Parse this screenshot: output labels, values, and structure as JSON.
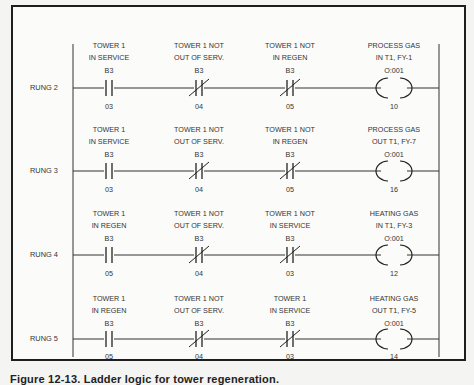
{
  "diagram": {
    "type": "ladder-logic",
    "rails": {
      "left_x": 73,
      "right_x": 439
    },
    "columns_x": [
      109,
      199,
      290,
      394
    ],
    "rungs": [
      {
        "label": "RUNG 2",
        "y": 88,
        "elements": [
          {
            "kind": "NO",
            "desc1": "TOWER 1",
            "desc2": "IN SERVICE",
            "addr": "B3",
            "bit": "03"
          },
          {
            "kind": "NC",
            "desc1": "TOWER 1 NOT",
            "desc2": "OUT OF SERV.",
            "addr": "B3",
            "bit": "04"
          },
          {
            "kind": "NC",
            "desc1": "TOWER 1 NOT",
            "desc2": "IN REGEN",
            "addr": "B3",
            "bit": "05"
          },
          {
            "kind": "COIL",
            "desc1": "PROCESS GAS",
            "desc2": "IN T1, FY-1",
            "addr": "O:001",
            "bit": "10"
          }
        ]
      },
      {
        "label": "RUNG 3",
        "y": 171,
        "elements": [
          {
            "kind": "NO",
            "desc1": "TOWER 1",
            "desc2": "IN SERVICE",
            "addr": "B3",
            "bit": "03"
          },
          {
            "kind": "NC",
            "desc1": "TOWER 1 NOT",
            "desc2": "OUT OF SERV.",
            "addr": "B3",
            "bit": "04"
          },
          {
            "kind": "NC",
            "desc1": "TOWER 1 NOT",
            "desc2": "IN REGEN",
            "addr": "B3",
            "bit": "05"
          },
          {
            "kind": "COIL",
            "desc1": "PROCESS GAS",
            "desc2": "OUT T1, FY-7",
            "addr": "O:001",
            "bit": "16"
          }
        ]
      },
      {
        "label": "RUNG 4",
        "y": 255,
        "elements": [
          {
            "kind": "NO",
            "desc1": "TOWER 1",
            "desc2": "IN REGEN",
            "addr": "B3",
            "bit": "05"
          },
          {
            "kind": "NC",
            "desc1": "TOWER 1 NOT",
            "desc2": "OUT OF SERV.",
            "addr": "B3",
            "bit": "04"
          },
          {
            "kind": "NC",
            "desc1": "TOWER 1 NOT",
            "desc2": "IN SERVICE",
            "addr": "B3",
            "bit": "03"
          },
          {
            "kind": "COIL",
            "desc1": "HEATING GAS",
            "desc2": "IN T1, FY-3",
            "addr": "O:001",
            "bit": "12"
          }
        ]
      },
      {
        "label": "RUNG 5",
        "y": 339,
        "elements": [
          {
            "kind": "NO",
            "desc1": "TOWER 1",
            "desc2": "IN REGEN",
            "addr": "B3",
            "bit": "05"
          },
          {
            "kind": "NC",
            "desc1": "TOWER 1 NOT",
            "desc2": "OUT OF SERV.",
            "addr": "B3",
            "bit": "04"
          },
          {
            "kind": "NC",
            "desc1": "TOWER 1",
            "desc2": "IN SERVICE",
            "addr": "B3",
            "bit": "03"
          },
          {
            "kind": "COIL",
            "desc1": "HEATING GAS",
            "desc2": "OUT  T1, FY-5",
            "addr": "O:001",
            "bit": "14"
          }
        ]
      }
    ]
  },
  "caption": "Figure 12-13. Ladder logic for tower regeneration."
}
